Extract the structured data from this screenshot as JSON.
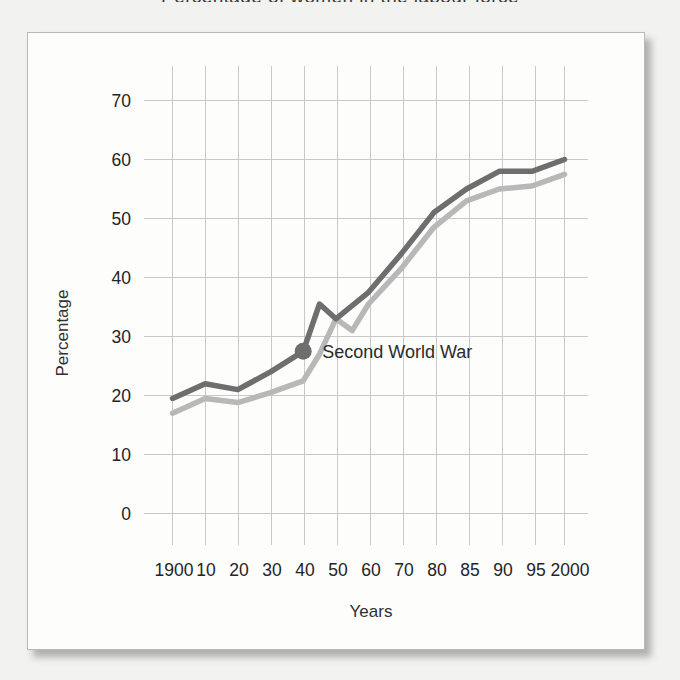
{
  "title_fragment": "Percentage of women in the labour force",
  "chart_data": {
    "type": "line",
    "title": "",
    "xlabel": "Years",
    "ylabel": "Percentage",
    "categories": [
      "1900",
      "10",
      "20",
      "30",
      "40",
      "50",
      "60",
      "70",
      "80",
      "85",
      "90",
      "95",
      "2000"
    ],
    "ylim": [
      0,
      70
    ],
    "yticks": [
      0,
      10,
      20,
      30,
      40,
      50,
      60,
      70
    ],
    "grid": true,
    "legend": "none",
    "series": [
      {
        "name": "dark-line",
        "color": "#6e6e6e",
        "x": [
          0,
          1,
          2,
          3,
          4,
          4.5,
          5,
          6,
          7,
          8,
          9,
          10,
          11,
          12
        ],
        "values": [
          19.5,
          22,
          21,
          24,
          27.5,
          35.5,
          33,
          37.5,
          44,
          51,
          55,
          58,
          58,
          60
        ]
      },
      {
        "name": "light-line",
        "color": "#b8b8b8",
        "x": [
          0,
          1,
          2,
          3,
          4,
          4.5,
          5,
          5.5,
          6,
          7,
          8,
          9,
          10,
          11,
          12
        ],
        "values": [
          17,
          19.5,
          18.8,
          20.5,
          22.5,
          27,
          33,
          31,
          35.5,
          41.5,
          48.5,
          53,
          55,
          55.5,
          57.5
        ]
      }
    ],
    "annotations": [
      {
        "text": "Second World War",
        "marker": "filled-circle",
        "marker_color": "#6e6e6e",
        "x_category": "40",
        "value": 27.5
      }
    ]
  }
}
